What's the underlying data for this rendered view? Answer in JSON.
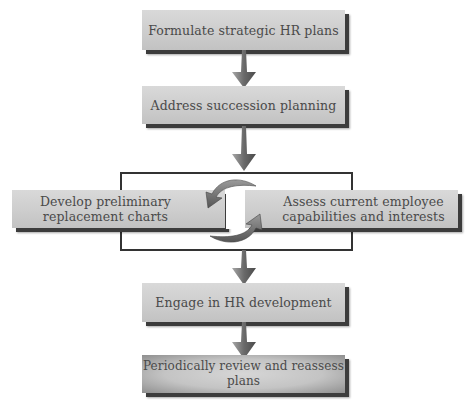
{
  "diagram": {
    "type": "flowchart",
    "steps": [
      {
        "id": "step1",
        "label": "Formulate strategic HR plans"
      },
      {
        "id": "step2",
        "label": "Address succession planning"
      },
      {
        "id": "step3a",
        "label_line1": "Develop preliminary",
        "label_line2": "replacement charts"
      },
      {
        "id": "step3b",
        "label_line1": "Assess current employee",
        "label_line2": "capabilities and interests"
      },
      {
        "id": "step4",
        "label": "Engage in HR development"
      },
      {
        "id": "step5",
        "label": "Periodically review and reassess plans"
      }
    ],
    "connectors": [
      {
        "from": "step1",
        "to": "step2",
        "icon": "down-arrow-icon"
      },
      {
        "from": "step2",
        "to": "step3-group",
        "icon": "down-arrow-icon"
      },
      {
        "between": [
          "step3a",
          "step3b"
        ],
        "icon": "cycle-arrows-icon"
      },
      {
        "from": "step3-group",
        "to": "step4",
        "icon": "down-arrow-icon"
      },
      {
        "from": "step4",
        "to": "step5",
        "icon": "down-arrow-icon"
      }
    ],
    "colors": {
      "box_fill": "#cdcdcd",
      "box_shadow": "#3c3c3c",
      "text": "#4a4a4a",
      "arrow": "#7a7a7a",
      "frame": "#333333"
    }
  }
}
